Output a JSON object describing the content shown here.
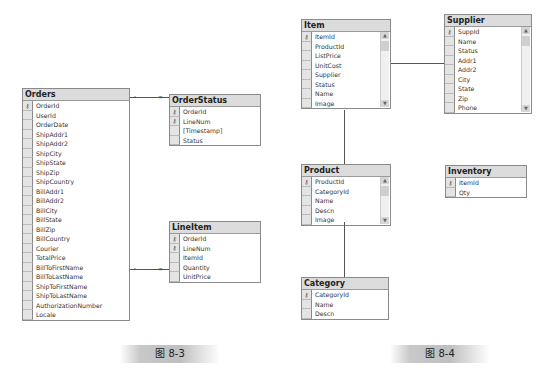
{
  "figure_8_3": {
    "caption": "图 8-3",
    "tables": {
      "orders": {
        "title": "Orders",
        "columns": [
          {
            "name": "OrderId",
            "pk": true
          },
          {
            "name": "UserId",
            "pk": false
          },
          {
            "name": "OrderDate",
            "pk": false
          },
          {
            "name": "ShipAddr1",
            "pk": false
          },
          {
            "name": "ShipAddr2",
            "pk": false
          },
          {
            "name": "ShipCity",
            "pk": false
          },
          {
            "name": "ShipState",
            "pk": false
          },
          {
            "name": "ShipZip",
            "pk": false
          },
          {
            "name": "ShipCountry",
            "pk": false
          },
          {
            "name": "BillAddr1",
            "pk": false
          },
          {
            "name": "BillAddr2",
            "pk": false
          },
          {
            "name": "BillCity",
            "pk": false
          },
          {
            "name": "BillState",
            "pk": false
          },
          {
            "name": "BillZip",
            "pk": false
          },
          {
            "name": "BillCountry",
            "pk": false
          },
          {
            "name": "Courier",
            "pk": false
          },
          {
            "name": "TotalPrice",
            "pk": false
          },
          {
            "name": "BillToFirstName",
            "pk": false
          },
          {
            "name": "BillToLastName",
            "pk": false
          },
          {
            "name": "ShipToFirstName",
            "pk": false
          },
          {
            "name": "ShipToLastName",
            "pk": false
          },
          {
            "name": "AuthorizationNumber",
            "pk": false
          },
          {
            "name": "Locale",
            "pk": false
          }
        ]
      },
      "order_status": {
        "title": "OrderStatus",
        "columns": [
          {
            "name": "OrderId",
            "pk": true
          },
          {
            "name": "LineNum",
            "pk": true
          },
          {
            "name": "[Timestamp]",
            "pk": false
          },
          {
            "name": "Status",
            "pk": false
          }
        ]
      },
      "line_item": {
        "title": "LineItem",
        "columns": [
          {
            "name": "OrderId",
            "pk": true
          },
          {
            "name": "LineNum",
            "pk": true
          },
          {
            "name": "ItemId",
            "pk": false
          },
          {
            "name": "Quantity",
            "pk": false
          },
          {
            "name": "UnitPrice",
            "pk": false
          }
        ]
      }
    }
  },
  "figure_8_4": {
    "caption": "图 8-4",
    "tables": {
      "item": {
        "title": "Item",
        "columns": [
          {
            "name": "ItemId",
            "pk": true
          },
          {
            "name": "ProductId",
            "pk": false
          },
          {
            "name": "ListPrice",
            "pk": false
          },
          {
            "name": "UnitCost",
            "pk": false
          },
          {
            "name": "Supplier",
            "pk": false
          },
          {
            "name": "Status",
            "pk": false
          },
          {
            "name": "Name",
            "pk": false
          },
          {
            "name": "Image",
            "pk": false
          }
        ]
      },
      "supplier": {
        "title": "Supplier",
        "columns": [
          {
            "name": "SuppId",
            "pk": true
          },
          {
            "name": "Name",
            "pk": false
          },
          {
            "name": "Status",
            "pk": false
          },
          {
            "name": "Addr1",
            "pk": false
          },
          {
            "name": "Addr2",
            "pk": false
          },
          {
            "name": "City",
            "pk": false
          },
          {
            "name": "State",
            "pk": false
          },
          {
            "name": "Zip",
            "pk": false
          },
          {
            "name": "Phone",
            "pk": false
          }
        ]
      },
      "product": {
        "title": "Product",
        "columns": [
          {
            "name": "ProductId",
            "pk": true
          },
          {
            "name": "CategoryId",
            "pk": false
          },
          {
            "name": "Name",
            "pk": false
          },
          {
            "name": "Descn",
            "pk": false
          },
          {
            "name": "Image",
            "pk": false
          }
        ]
      },
      "inventory": {
        "title": "Inventory",
        "columns": [
          {
            "name": "ItemId",
            "pk": true
          },
          {
            "name": "Qty",
            "pk": false
          }
        ]
      },
      "category": {
        "title": "Category",
        "columns": [
          {
            "name": "CategoryId",
            "pk": true
          },
          {
            "name": "Name",
            "pk": false
          },
          {
            "name": "Descn",
            "pk": false
          }
        ]
      }
    }
  },
  "icons": {
    "primary_key": "key-icon",
    "scroll_up": "▲",
    "scroll_down": "▼",
    "key_glyph": "⚷"
  }
}
